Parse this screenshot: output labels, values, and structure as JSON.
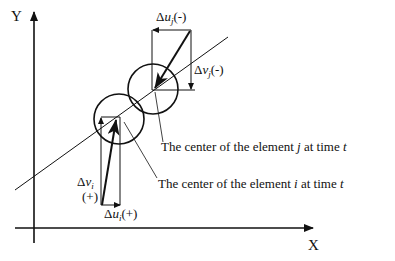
{
  "diagram": {
    "axes": {
      "x_label": "X",
      "y_label": "Y"
    },
    "labels": {
      "delta_u_j": {
        "symbol": "Δ",
        "var": "u",
        "sub": "j",
        "sign": "(-)"
      },
      "delta_v_j": {
        "symbol": "Δ",
        "var": "v",
        "sub": "j",
        "sign": "(-)"
      },
      "delta_v_i": {
        "symbol": "Δ",
        "var": "v",
        "sub": "i",
        "sign": "(+)"
      },
      "delta_u_i": {
        "symbol": "Δ",
        "var": "u",
        "sub": "i",
        "sign": "(+)"
      }
    },
    "captions": {
      "center_j": {
        "prefix": "The center of the element ",
        "var": "j",
        "mid": " at time ",
        "t": "t"
      },
      "center_i": {
        "prefix": "The center of the element ",
        "var": "i",
        "mid": " at time ",
        "t": "t"
      }
    },
    "colors": {
      "ink": "#111111",
      "background": "#ffffff"
    }
  }
}
